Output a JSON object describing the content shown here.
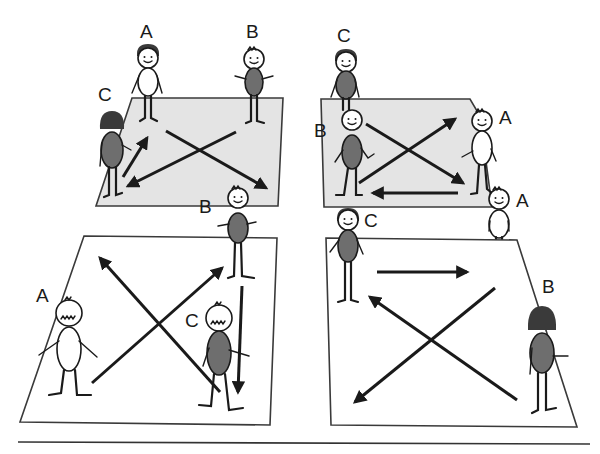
{
  "diagram": {
    "panels": [
      {
        "id": "top-left",
        "court_fill": "#e4e4e4",
        "players": [
          {
            "label": "A",
            "shirt": "light"
          },
          {
            "label": "B",
            "shirt": "dark"
          },
          {
            "label": "C",
            "shirt": "dark"
          }
        ],
        "arrows": [
          "C to A",
          "B to C",
          "A to B"
        ]
      },
      {
        "id": "top-right",
        "court_fill": "#e4e4e4",
        "players": [
          {
            "label": "C",
            "shirt": "dark"
          },
          {
            "label": "B",
            "shirt": "dark"
          },
          {
            "label": "A",
            "shirt": "light"
          },
          {
            "label": "A",
            "shirt": "light"
          }
        ],
        "arrows": [
          "B to A",
          "B to A (lower)",
          "A to B"
        ]
      },
      {
        "id": "bottom-left",
        "court_fill": "#ffffff",
        "players": [
          {
            "label": "B",
            "shirt": "dark"
          },
          {
            "label": "A",
            "shirt": "light"
          },
          {
            "label": "C",
            "shirt": "dark"
          }
        ],
        "arrows": [
          "A to B",
          "C to upper-left",
          "B to C"
        ]
      },
      {
        "id": "bottom-right",
        "court_fill": "#ffffff",
        "players": [
          {
            "label": "C",
            "shirt": "dark"
          },
          {
            "label": "A",
            "shirt": "light"
          },
          {
            "label": "B",
            "shirt": "dark"
          }
        ],
        "arrows": [
          "C to A",
          "A to lower-left",
          "B to C"
        ]
      }
    ],
    "colors": {
      "line": "#1a1a1a",
      "court_grey": "#e4e4e4",
      "shirt_dark": "#6e6e6e"
    }
  }
}
